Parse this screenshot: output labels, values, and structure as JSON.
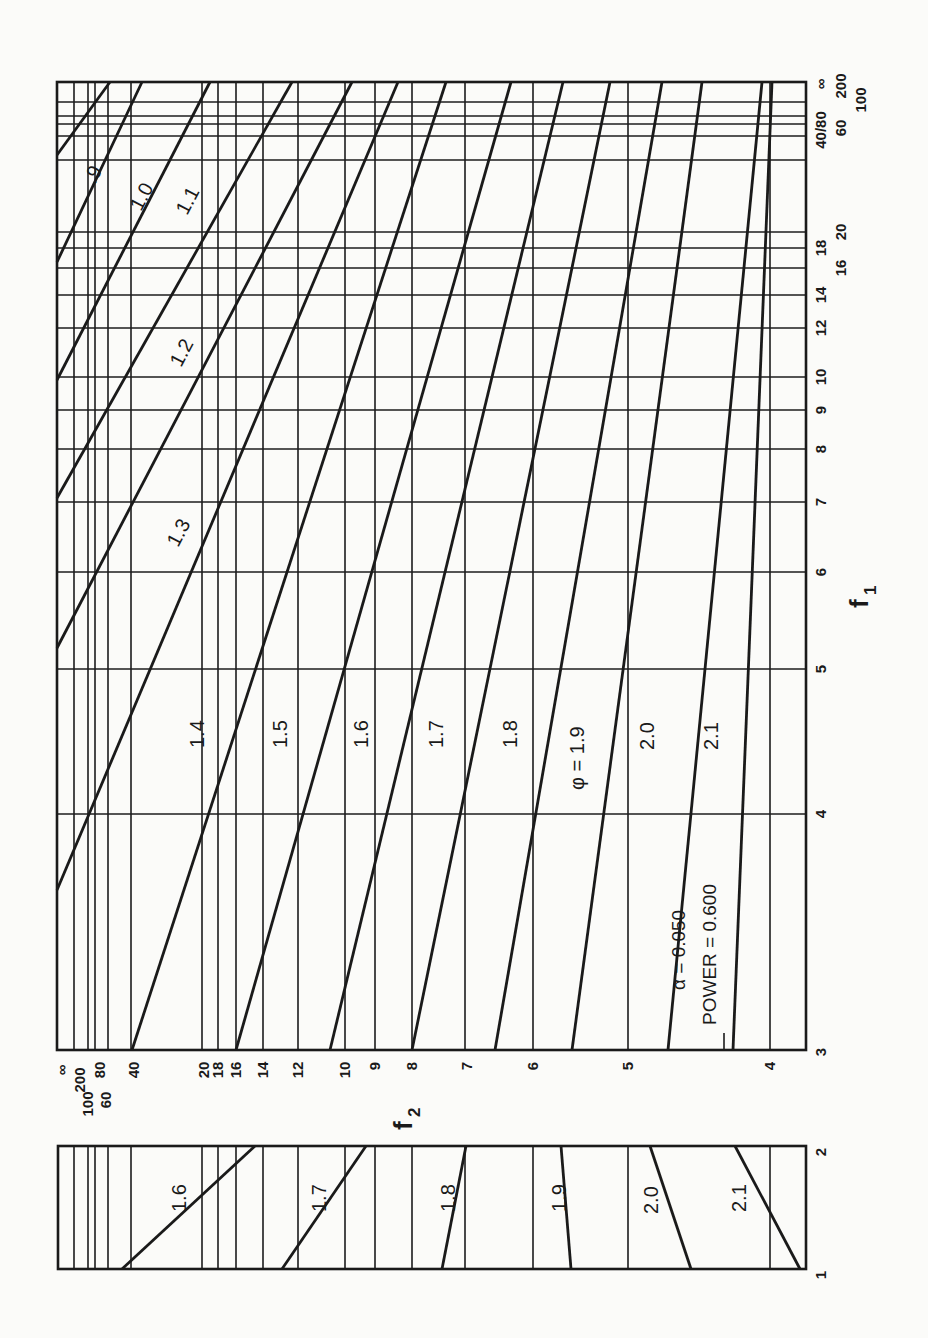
{
  "chart_data": {
    "type": "line",
    "annotation": {
      "alpha_label": "α  = 0.050",
      "power_label": "POWER = 0.600"
    },
    "xlabel": "f1",
    "ylabel": "f2",
    "series_param": "φ",
    "f1_ticks": [
      "3",
      "4",
      "5",
      "6",
      "7",
      "8",
      "9",
      "10",
      "12",
      "14",
      "16",
      "18",
      "20",
      "40",
      "60",
      "80",
      "100",
      "200",
      "∞"
    ],
    "f2_ticks": [
      "3",
      "4",
      "5",
      "6",
      "7",
      "8",
      "9",
      "10",
      "12",
      "14",
      "16",
      "18",
      "20",
      "40",
      "60",
      "80",
      "100",
      "200",
      "∞"
    ],
    "main_panel": {
      "f1_range": [
        "3",
        "∞"
      ],
      "f2_range": [
        "3",
        "∞"
      ],
      "series": [
        {
          "name": "φ = .9",
          "label": ".9"
        },
        {
          "name": "φ = 1.0",
          "label": "1.0"
        },
        {
          "name": "φ = 1.1",
          "label": "1.1"
        },
        {
          "name": "φ = 1.2",
          "label": "1.2"
        },
        {
          "name": "φ = 1.3",
          "label": "1.3"
        },
        {
          "name": "φ = 1.4",
          "label": "1.4"
        },
        {
          "name": "φ = 1.5",
          "label": "1.5"
        },
        {
          "name": "φ = 1.6",
          "label": "1.6"
        },
        {
          "name": "φ = 1.7",
          "label": "1.7"
        },
        {
          "name": "φ = 1.8",
          "label": "1.8"
        },
        {
          "name": "φ = 1.9",
          "label": "φ = 1.9"
        },
        {
          "name": "φ = 2.0",
          "label": "2.0"
        },
        {
          "name": "φ = 2.1",
          "label": "2.1"
        }
      ]
    },
    "inset_panel": {
      "f1_ticks": [
        "1",
        "2"
      ],
      "f2_range": [
        "4",
        "∞"
      ],
      "series": [
        {
          "name": "φ = 1.6",
          "label": "1.6"
        },
        {
          "name": "φ = 1.7",
          "label": "1.7"
        },
        {
          "name": "φ = 1.8",
          "label": "1.8"
        },
        {
          "name": "φ = 1.9",
          "label": "1.9"
        },
        {
          "name": "φ = 2.0",
          "label": "2.0"
        },
        {
          "name": "φ = 2.1",
          "label": "2.1"
        }
      ]
    }
  },
  "labels": {
    "f1_axis_title": "f",
    "f1_axis_sub": "1",
    "f2_axis_title": "f",
    "f2_axis_sub": "2",
    "alpha": "α  = 0.050",
    "power": "POWER = 0.600",
    "phi_prefix": "φ = 1.9",
    "main_curve_labels": [
      ".9",
      "1.0",
      "1.1",
      "1.2",
      "1.3",
      "1.4",
      "1.5",
      "1.6",
      "1.7",
      "1.8",
      "2.0",
      "2.1"
    ],
    "inset_curve_labels": [
      "1.6",
      "1.7",
      "1.8",
      "1.9",
      "2.0",
      "2.1"
    ],
    "f1_tick_labels": [
      "3",
      "4",
      "5",
      "6",
      "7",
      "8",
      "9",
      "10",
      "12",
      "14",
      "16",
      "18",
      "20",
      "40",
      "60",
      "80",
      "100",
      "200",
      "∞"
    ],
    "f2_tick_labels": [
      "∞",
      "200",
      "100",
      "80",
      "60",
      "40",
      "20",
      "18",
      "16",
      "14",
      "12",
      "10",
      "9",
      "8",
      "7",
      "6",
      "5",
      "4"
    ],
    "inset_f1_ticks": [
      "2",
      "1"
    ]
  },
  "geometry": {
    "main": {
      "left": 57,
      "top": 82,
      "right": 806,
      "bottom": 1050
    },
    "inset": {
      "left": 58,
      "top": 1146,
      "right": 806,
      "bottom": 1269
    },
    "f1_rows": [
      {
        "v": "∞",
        "y": 82
      },
      {
        "v": "200",
        "y": 102
      },
      {
        "v": "100",
        "y": 116
      },
      {
        "v": "80",
        "y": 124
      },
      {
        "v": "60",
        "y": 136
      },
      {
        "v": "40",
        "y": 160
      },
      {
        "v": "20",
        "y": 232
      },
      {
        "v": "18",
        "y": 248
      },
      {
        "v": "16",
        "y": 268
      },
      {
        "v": "14",
        "y": 295
      },
      {
        "v": "12",
        "y": 328
      },
      {
        "v": "10",
        "y": 377
      },
      {
        "v": "9",
        "y": 410
      },
      {
        "v": "8",
        "y": 449
      },
      {
        "v": "7",
        "y": 502
      },
      {
        "v": "6",
        "y": 572
      },
      {
        "v": "5",
        "y": 669
      },
      {
        "v": "4",
        "y": 814
      },
      {
        "v": "3",
        "y": 1050
      }
    ],
    "f2_cols": [
      {
        "v": "∞",
        "x": 57
      },
      {
        "v": "200",
        "x": 74
      },
      {
        "v": "100",
        "x": 88
      },
      {
        "v": "80",
        "x": 95
      },
      {
        "v": "60",
        "x": 108
      },
      {
        "v": "40",
        "x": 131
      },
      {
        "v": "20",
        "x": 202
      },
      {
        "v": "18",
        "x": 218
      },
      {
        "v": "16",
        "x": 236
      },
      {
        "v": "14",
        "x": 263
      },
      {
        "v": "12",
        "x": 298
      },
      {
        "v": "10",
        "x": 345
      },
      {
        "v": "9",
        "x": 375
      },
      {
        "v": "8",
        "x": 412
      },
      {
        "v": "7",
        "x": 465
      },
      {
        "v": "6",
        "x": 533
      },
      {
        "v": "5",
        "x": 628
      },
      {
        "v": "4",
        "x": 770
      },
      {
        "v": "3",
        "x": 806
      }
    ],
    "main_curves": [
      {
        "label": ".9",
        "pts": [
          [
            57,
            155
          ],
          [
            110,
            82
          ]
        ]
      },
      {
        "label": "1.0",
        "pts": [
          [
            57,
            262
          ],
          [
            142,
            82
          ]
        ]
      },
      {
        "label": "1.1",
        "pts": [
          [
            57,
            380
          ],
          [
            210,
            82
          ]
        ]
      },
      {
        "label": "1.2",
        "pts": [
          [
            57,
            498
          ],
          [
            292,
            82
          ]
        ]
      },
      {
        "label": "1.3",
        "pts": [
          [
            57,
            648
          ],
          [
            352,
            82
          ]
        ]
      },
      {
        "label": "1.4",
        "pts": [
          [
            57,
            890
          ],
          [
            398,
            82
          ]
        ]
      },
      {
        "label": "1.5",
        "pts": [
          [
            132,
            1050
          ],
          [
            446,
            82
          ]
        ]
      },
      {
        "label": "1.6",
        "pts": [
          [
            236,
            1050
          ],
          [
            511,
            82
          ]
        ]
      },
      {
        "label": "1.7",
        "pts": [
          [
            330,
            1050
          ],
          [
            563,
            82
          ]
        ]
      },
      {
        "label": "1.8",
        "pts": [
          [
            412,
            1050
          ],
          [
            610,
            82
          ]
        ]
      },
      {
        "label": "1.9",
        "pts": [
          [
            495,
            1050
          ],
          [
            662,
            82
          ]
        ]
      },
      {
        "label": "2.0",
        "pts": [
          [
            572,
            1050
          ],
          [
            702,
            82
          ]
        ]
      },
      {
        "label": "2.1",
        "pts": [
          [
            668,
            1050
          ],
          [
            762,
            82
          ]
        ]
      },
      {
        "label": "",
        "pts": [
          [
            733,
            1050
          ],
          [
            772,
            82
          ]
        ]
      }
    ],
    "inset_rows": [],
    "inset_curves": [
      {
        "label": "1.6",
        "pts": [
          [
            122,
            1269
          ],
          [
            255,
            1146
          ]
        ]
      },
      {
        "label": "1.7",
        "pts": [
          [
            282,
            1269
          ],
          [
            366,
            1146
          ]
        ]
      },
      {
        "label": "1.8",
        "pts": [
          [
            442,
            1269
          ],
          [
            466,
            1146
          ]
        ]
      },
      {
        "label": "1.9",
        "pts": [
          [
            571,
            1269
          ],
          [
            561,
            1146
          ]
        ]
      },
      {
        "label": "2.0",
        "pts": [
          [
            691,
            1269
          ],
          [
            650,
            1146
          ]
        ]
      },
      {
        "label": "2.1",
        "pts": [
          [
            800,
            1269
          ],
          [
            735,
            1146
          ]
        ]
      }
    ]
  }
}
